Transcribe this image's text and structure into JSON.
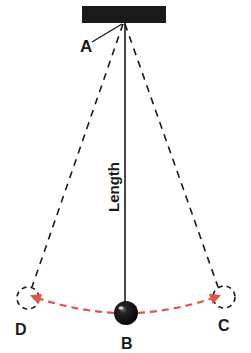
{
  "diagram": {
    "labels": {
      "pivot": "A",
      "bottom": "B",
      "right_extreme": "C",
      "left_extreme": "D",
      "length": "Length"
    },
    "colors": {
      "ink": "#1a1a1a",
      "swing_arc": "#e0534a",
      "background": "#ffffff"
    }
  }
}
